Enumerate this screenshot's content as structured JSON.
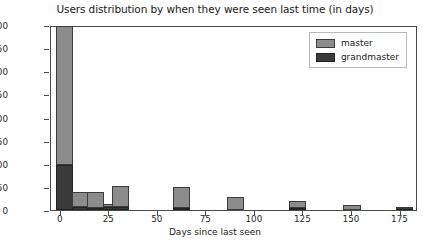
{
  "chart_data": {
    "type": "bar",
    "title": "Users distribution by when they were seen last time (in days)",
    "xlabel": "Days since last seen",
    "ylabel": "Count",
    "xlim": [
      -5,
      184
    ],
    "ylim": [
      0,
      400
    ],
    "grid": false,
    "legend_position": "upper right",
    "xticks": [
      0,
      25,
      50,
      75,
      100,
      125,
      150,
      175
    ],
    "yticks": [
      0,
      50,
      100,
      150,
      200,
      250,
      300,
      350,
      400
    ],
    "stacked": true,
    "bin_width": 8.8,
    "bin_centers": [
      2,
      10,
      18,
      26,
      31,
      62,
      90,
      122,
      150,
      177
    ],
    "series": [
      {
        "name": "master",
        "color": "#8c8c8c",
        "values": [
          299,
          34,
          36,
          8,
          45,
          45,
          28,
          15,
          10,
          5
        ]
      },
      {
        "name": "grandmaster",
        "color": "#3a3a3a",
        "values": [
          98,
          6,
          4,
          6,
          6,
          5,
          0,
          5,
          0,
          2
        ]
      }
    ],
    "totals": [
      397,
      40,
      40,
      14,
      51,
      50,
      28,
      20,
      10,
      7
    ]
  }
}
